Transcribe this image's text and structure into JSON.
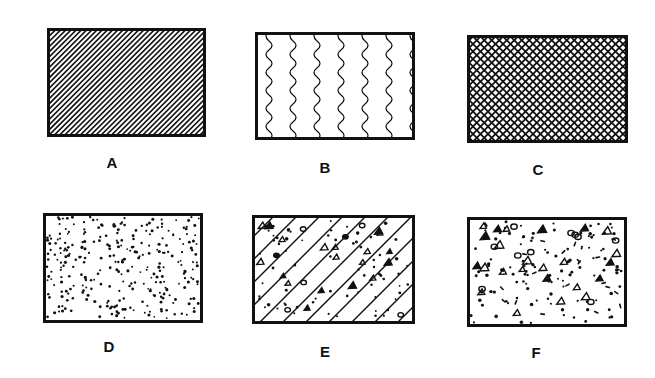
{
  "figure": {
    "panels": [
      {
        "id": "A",
        "label": "A",
        "pattern": "diagonal-hatch",
        "box": [
          47,
          28,
          159,
          109
        ],
        "label_pos": [
          112,
          163
        ]
      },
      {
        "id": "B",
        "label": "B",
        "pattern": "wavy-vertical-lines",
        "box": [
          255,
          32,
          160,
          108
        ],
        "label_pos": [
          325,
          168
        ]
      },
      {
        "id": "C",
        "label": "C",
        "pattern": "cross-hatch",
        "box": [
          467,
          35,
          161,
          108
        ],
        "label_pos": [
          538,
          170
        ]
      },
      {
        "id": "D",
        "label": "D",
        "pattern": "stipple-dots",
        "box": [
          43,
          213,
          160,
          110
        ],
        "label_pos": [
          109,
          347
        ]
      },
      {
        "id": "E",
        "label": "E",
        "pattern": "diagonal-hatch-with-aggregate",
        "box": [
          252,
          215,
          163,
          109
        ],
        "label_pos": [
          325,
          352
        ]
      },
      {
        "id": "F",
        "label": "F",
        "pattern": "dots-with-aggregate",
        "box": [
          467,
          217,
          160,
          110
        ],
        "label_pos": [
          536,
          353
        ]
      }
    ],
    "stroke_color": "#111111",
    "background": "#ffffff"
  }
}
